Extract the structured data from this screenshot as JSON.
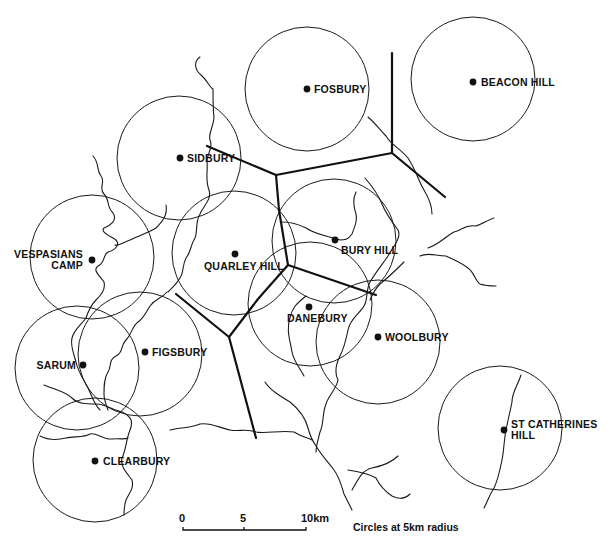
{
  "map": {
    "title": "Hillfort territories with 5km radius circles",
    "sites": [
      {
        "name": "FOSBURY",
        "x": 307,
        "y": 89
      },
      {
        "name": "BEACON HILL",
        "x": 473,
        "y": 82
      },
      {
        "name": "SIDBURY",
        "x": 180,
        "y": 158
      },
      {
        "name": "VESPASIANS CAMP",
        "line1": "VESPASIANS",
        "line2": "CAMP",
        "x": 92,
        "y": 260
      },
      {
        "name": "QUARLEY HILL",
        "x": 235,
        "y": 254
      },
      {
        "name": "BURY HILL",
        "x": 335,
        "y": 240
      },
      {
        "name": "DANEBURY",
        "x": 309,
        "y": 307
      },
      {
        "name": "WOOLBURY",
        "x": 378,
        "y": 337
      },
      {
        "name": "SARUM",
        "x": 83,
        "y": 365
      },
      {
        "name": "FIGSBURY",
        "x": 145,
        "y": 352
      },
      {
        "name": "CLEARBURY",
        "x": 95,
        "y": 461
      },
      {
        "name": "ST CATHERINES HILL",
        "line1": "ST CATHERINES",
        "line2": "HILL",
        "x": 504,
        "y": 430
      }
    ],
    "circle_radius_px": 62
  },
  "scale_bar": {
    "ticks": [
      "0",
      "5",
      "10km"
    ],
    "unit": "km",
    "length_km": 10
  },
  "legend": {
    "note": "Circles at 5km radius"
  }
}
